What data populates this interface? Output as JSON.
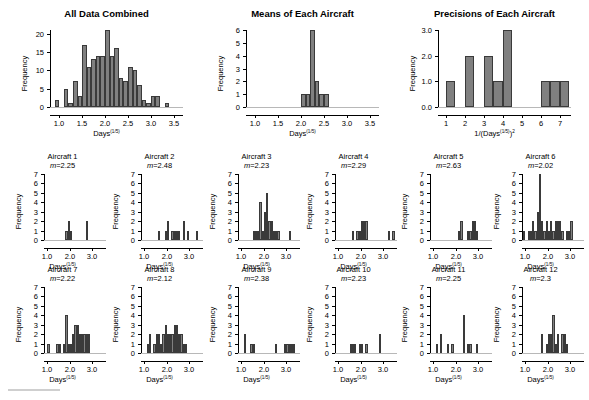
{
  "figure": {
    "width": 589,
    "height": 400,
    "background": "#ffffff",
    "bar_color": "#808080",
    "bar_edge_color": "#3a3a3a",
    "axis_color": "#000000",
    "baseline_color": "#b8b8b8"
  },
  "labels": {
    "frequency": "Frequency",
    "days_axis": "Days",
    "days_exponent": "(1/5)",
    "precision_axis_prefix": "1/(Days",
    "precision_axis_exponent": "(1/5)",
    "precision_axis_suffix": ")",
    "precision_axis_power": "2",
    "mean_prefix": "m="
  },
  "chart_data": [
    {
      "id": "all-data-combined",
      "type": "bar",
      "title": "All Data Combined",
      "xlabel": "Days^(1/5)",
      "ylabel": "Frequency",
      "xlim": [
        0.8,
        3.7
      ],
      "ylim": [
        0,
        21
      ],
      "xticks": [
        1.0,
        1.5,
        2.0,
        2.5,
        3.0,
        3.5
      ],
      "xtick_labels": [
        "1.0",
        "1.5",
        "2.0",
        "2.5",
        "3.0",
        "3.5"
      ],
      "yticks": [
        0,
        5,
        10,
        15,
        20
      ],
      "ytick_labels": [
        "0",
        "5",
        "10",
        "15",
        "20"
      ],
      "bin_width": 0.1,
      "bin_starts": [
        0.9,
        1.1,
        1.2,
        1.3,
        1.4,
        1.5,
        1.6,
        1.7,
        1.8,
        1.9,
        2.0,
        2.1,
        2.2,
        2.3,
        2.4,
        2.5,
        2.6,
        2.7,
        2.8,
        2.9,
        3.0,
        3.1,
        3.2,
        3.3,
        3.4,
        3.5
      ],
      "values": [
        2,
        5,
        1,
        7,
        3,
        17,
        11,
        13,
        14,
        14,
        21,
        14,
        16,
        8,
        7,
        11,
        10,
        6,
        2,
        1,
        3,
        3,
        0,
        1,
        0,
        0
      ],
      "grid": false,
      "legend": false
    },
    {
      "id": "means-of-each-aircraft",
      "type": "bar",
      "title": "Means of Each Aircraft",
      "xlabel": "Days^(1/5)",
      "ylabel": "Frequency",
      "xlim": [
        0.8,
        3.7
      ],
      "ylim": [
        0,
        6
      ],
      "xticks": [
        1.0,
        1.5,
        2.0,
        2.5,
        3.0,
        3.5
      ],
      "xtick_labels": [
        "1.0",
        "1.5",
        "2.0",
        "2.5",
        "3.0",
        "3.5"
      ],
      "yticks": [
        0,
        1,
        2,
        3,
        4,
        5,
        6
      ],
      "ytick_labels": [
        "0",
        "1",
        "2",
        "3",
        "4",
        "5",
        "6"
      ],
      "bin_width": 0.1,
      "bin_starts": [
        2.0,
        2.1,
        2.2,
        2.3,
        2.4,
        2.5
      ],
      "values": [
        1,
        1,
        6,
        2,
        1,
        1
      ],
      "grid": false,
      "legend": false
    },
    {
      "id": "precisions-of-each-aircraft",
      "type": "bar",
      "title": "Precisions of Each Aircraft",
      "xlabel": "1/(Days^(1/5))^2",
      "ylabel": "Frequency",
      "xlim": [
        0.6,
        7.6
      ],
      "ylim": [
        0,
        3.0
      ],
      "xticks": [
        1,
        2,
        3,
        4,
        5,
        6,
        7
      ],
      "xtick_labels": [
        "1",
        "2",
        "3",
        "4",
        "5",
        "6",
        "7"
      ],
      "yticks": [
        0.0,
        1.0,
        2.0,
        3.0
      ],
      "ytick_labels": [
        "0.0",
        "1.0",
        "2.0",
        "3.0"
      ],
      "bin_width": 0.5,
      "bin_starts": [
        1.0,
        2.0,
        3.0,
        3.5,
        4.0,
        6.0,
        6.5,
        7.0
      ],
      "values": [
        1,
        2,
        2,
        1,
        3,
        1,
        1,
        1
      ],
      "grid": false,
      "legend": false
    },
    {
      "id": "aircraft-1",
      "type": "bar",
      "title": "Aircraft 1",
      "mean_label": "m=2.25",
      "mean": 2.25,
      "xlabel": "Days^(1/5)",
      "ylabel": "Frequency",
      "xlim": [
        0.85,
        3.6
      ],
      "ylim": [
        0,
        7
      ],
      "xticks": [
        1.0,
        2.0,
        3.0
      ],
      "xtick_labels": [
        "1.0",
        "2.0",
        "3.0"
      ],
      "yticks": [
        0,
        1,
        2,
        3,
        4,
        5,
        6,
        7
      ],
      "ytick_labels": [
        "0",
        "1",
        "2",
        "3",
        "4",
        "5",
        "6",
        "7"
      ],
      "bin_width": 0.1,
      "bin_starts": [
        1.8,
        1.9,
        2.0,
        2.7
      ],
      "values": [
        1,
        2,
        1,
        2
      ],
      "grid": false,
      "legend": false
    },
    {
      "id": "aircraft-2",
      "type": "bar",
      "title": "Aircraft 2",
      "mean_label": "m=2.48",
      "mean": 2.48,
      "xlabel": "Days^(1/5)",
      "ylabel": "Frequency",
      "xlim": [
        0.85,
        3.6
      ],
      "ylim": [
        0,
        7
      ],
      "xticks": [
        1.0,
        2.0,
        3.0
      ],
      "xtick_labels": [
        "1.0",
        "2.0",
        "3.0"
      ],
      "yticks": [
        0,
        1,
        2,
        3,
        4,
        5,
        6,
        7
      ],
      "ytick_labels": [
        "0",
        "1",
        "2",
        "3",
        "4",
        "5",
        "6",
        "7"
      ],
      "bin_width": 0.1,
      "bin_starts": [
        1.6,
        1.9,
        2.0,
        2.2,
        2.3,
        2.4,
        2.5,
        2.7,
        2.9,
        3.3
      ],
      "values": [
        1,
        1,
        2,
        1,
        1,
        1,
        1,
        2,
        1,
        1
      ],
      "grid": false,
      "legend": false
    },
    {
      "id": "aircraft-3",
      "type": "bar",
      "title": "Aircraft 3",
      "mean_label": "m=2.23",
      "mean": 2.23,
      "xlabel": "Days^(1/5)",
      "ylabel": "Frequency",
      "xlim": [
        0.85,
        3.6
      ],
      "ylim": [
        0,
        7
      ],
      "xticks": [
        1.0,
        2.0,
        3.0
      ],
      "xtick_labels": [
        "1.0",
        "2.0",
        "3.0"
      ],
      "yticks": [
        0,
        1,
        2,
        3,
        4,
        5,
        6,
        7
      ],
      "ytick_labels": [
        "0",
        "1",
        "2",
        "3",
        "4",
        "5",
        "6",
        "7"
      ],
      "bin_width": 0.1,
      "bin_starts": [
        1.5,
        1.6,
        1.7,
        1.8,
        1.9,
        2.0,
        2.1,
        2.2,
        2.3,
        2.4,
        2.5,
        2.6,
        3.1
      ],
      "values": [
        1,
        1,
        1,
        4,
        1,
        3,
        5,
        2,
        2,
        1,
        1,
        1,
        1
      ],
      "grid": false,
      "legend": false
    },
    {
      "id": "aircraft-4",
      "type": "bar",
      "title": "Aircraft 4",
      "mean_label": "m=2.29",
      "mean": 2.29,
      "xlabel": "Days^(1/5)",
      "ylabel": "Frequency",
      "xlim": [
        0.85,
        3.6
      ],
      "ylim": [
        0,
        7
      ],
      "xticks": [
        1.0,
        2.0,
        3.0
      ],
      "xtick_labels": [
        "1.0",
        "2.0",
        "3.0"
      ],
      "yticks": [
        0,
        1,
        2,
        3,
        4,
        5,
        6,
        7
      ],
      "ytick_labels": [
        "0",
        "1",
        "2",
        "3",
        "4",
        "5",
        "6",
        "7"
      ],
      "bin_width": 0.1,
      "bin_starts": [
        1.6,
        1.8,
        1.9,
        2.0,
        2.1,
        2.2,
        3.2,
        3.4
      ],
      "values": [
        1,
        1,
        1,
        2,
        2,
        2,
        1,
        1
      ],
      "grid": false,
      "legend": false
    },
    {
      "id": "aircraft-5",
      "type": "bar",
      "title": "Aircraft 5",
      "mean_label": "m=2.63",
      "mean": 2.63,
      "xlabel": "Days^(1/5)",
      "ylabel": "Frequency",
      "xlim": [
        0.85,
        3.6
      ],
      "ylim": [
        0,
        7
      ],
      "xticks": [
        1.0,
        2.0,
        3.0
      ],
      "xtick_labels": [
        "1.0",
        "2.0",
        "3.0"
      ],
      "yticks": [
        0,
        1,
        2,
        3,
        4,
        5,
        6,
        7
      ],
      "ytick_labels": [
        "0",
        "1",
        "2",
        "3",
        "4",
        "5",
        "6",
        "7"
      ],
      "bin_width": 0.1,
      "bin_starts": [
        2.1,
        2.2,
        2.5,
        2.6,
        2.7,
        2.8,
        2.9
      ],
      "values": [
        1,
        2,
        1,
        1,
        2,
        2,
        1
      ],
      "grid": false,
      "legend": false
    },
    {
      "id": "aircraft-6",
      "type": "bar",
      "title": "Aircraft 6",
      "mean_label": "m=2.02",
      "mean": 2.02,
      "xlabel": "Days^(1/5)",
      "ylabel": "Frequency",
      "xlim": [
        0.85,
        3.6
      ],
      "ylim": [
        0,
        7
      ],
      "xticks": [
        1.0,
        2.0,
        3.0
      ],
      "xtick_labels": [
        "1.0",
        "2.0",
        "3.0"
      ],
      "yticks": [
        0,
        1,
        2,
        3,
        4,
        5,
        6,
        7
      ],
      "ytick_labels": [
        "0",
        "1",
        "2",
        "3",
        "4",
        "5",
        "6",
        "7"
      ],
      "bin_width": 0.1,
      "bin_starts": [
        0.9,
        1.1,
        1.2,
        1.3,
        1.4,
        1.5,
        1.6,
        1.7,
        1.8,
        1.9,
        2.0,
        2.1,
        2.2,
        2.3,
        2.4,
        2.5,
        2.6,
        2.8,
        2.9,
        3.0
      ],
      "values": [
        1,
        1,
        1,
        2,
        1,
        3,
        7,
        2,
        1,
        2,
        1,
        2,
        1,
        2,
        2,
        2,
        1,
        1,
        1,
        2
      ],
      "grid": false,
      "legend": false
    },
    {
      "id": "aircraft-7",
      "type": "bar",
      "title": "Aircraft 7",
      "mean_label": "m=2.22",
      "mean": 2.22,
      "xlabel": "Days^(1/5)",
      "ylabel": "Frequency",
      "xlim": [
        0.85,
        3.6
      ],
      "ylim": [
        0,
        7
      ],
      "xticks": [
        1.0,
        2.0,
        3.0
      ],
      "xtick_labels": [
        "1.0",
        "2.0",
        "3.0"
      ],
      "yticks": [
        0,
        1,
        2,
        3,
        4,
        5,
        6,
        7
      ],
      "ytick_labels": [
        "0",
        "1",
        "2",
        "3",
        "4",
        "5",
        "6",
        "7"
      ],
      "bin_width": 0.1,
      "bin_starts": [
        1.0,
        1.4,
        1.5,
        1.7,
        1.8,
        1.9,
        2.0,
        2.1,
        2.2,
        2.3,
        2.4,
        2.5,
        2.6,
        2.7,
        2.8
      ],
      "values": [
        1,
        1,
        1,
        1,
        4,
        1,
        1,
        2,
        3,
        3,
        2,
        2,
        2,
        2,
        2
      ],
      "grid": false,
      "legend": false
    },
    {
      "id": "aircraft-8",
      "type": "bar",
      "title": "Aircraft 8",
      "mean_label": "m=2.12",
      "mean": 2.12,
      "xlabel": "Days^(1/5)",
      "ylabel": "Frequency",
      "xlim": [
        0.85,
        3.6
      ],
      "ylim": [
        0,
        7
      ],
      "xticks": [
        1.0,
        2.0,
        3.0
      ],
      "xtick_labels": [
        "1.0",
        "2.0",
        "3.0"
      ],
      "yticks": [
        0,
        1,
        2,
        3,
        4,
        5,
        6,
        7
      ],
      "ytick_labels": [
        "0",
        "1",
        "2",
        "3",
        "4",
        "5",
        "6",
        "7"
      ],
      "bin_width": 0.1,
      "bin_starts": [
        1.1,
        1.2,
        1.4,
        1.5,
        1.6,
        1.7,
        1.8,
        1.9,
        2.0,
        2.1,
        2.2,
        2.3,
        2.4,
        2.5,
        2.6,
        2.7,
        2.8
      ],
      "values": [
        1,
        2,
        1,
        2,
        2,
        1,
        2,
        3,
        2,
        2,
        2,
        3,
        3,
        2,
        2,
        1,
        1
      ],
      "grid": false,
      "legend": false
    },
    {
      "id": "aircraft-9",
      "type": "bar",
      "title": "Aircraft 9",
      "mean_label": "m=2.38",
      "mean": 2.38,
      "xlabel": "Days^(1/5)",
      "ylabel": "Frequency",
      "xlim": [
        0.85,
        3.6
      ],
      "ylim": [
        0,
        7
      ],
      "xticks": [
        1.0,
        2.0,
        3.0
      ],
      "xtick_labels": [
        "1.0",
        "2.0",
        "3.0"
      ],
      "yticks": [
        0,
        1,
        2,
        3,
        4,
        5,
        6,
        7
      ],
      "ytick_labels": [
        "0",
        "1",
        "2",
        "3",
        "4",
        "5",
        "6",
        "7"
      ],
      "bin_width": 0.1,
      "bin_starts": [
        1.1,
        1.4,
        1.5,
        2.5,
        2.9,
        3.0,
        3.1,
        3.2,
        3.3
      ],
      "values": [
        2,
        1,
        1,
        1,
        1,
        1,
        1,
        1,
        1
      ],
      "grid": false,
      "legend": false
    },
    {
      "id": "aircraft-10",
      "type": "bar",
      "title": "Aircraft 10",
      "mean_label": "m=2.23",
      "mean": 2.23,
      "xlabel": "Days^(1/5)",
      "ylabel": "Frequency",
      "xlim": [
        0.85,
        3.6
      ],
      "ylim": [
        0,
        7
      ],
      "xticks": [
        1.0,
        2.0,
        3.0
      ],
      "xtick_labels": [
        "1.0",
        "2.0",
        "3.0"
      ],
      "yticks": [
        0,
        1,
        2,
        3,
        4,
        5,
        6,
        7
      ],
      "ytick_labels": [
        "0",
        "1",
        "2",
        "3",
        "4",
        "5",
        "6",
        "7"
      ],
      "bin_width": 0.1,
      "bin_starts": [
        1.5,
        1.6,
        1.7,
        1.9,
        2.0,
        2.2,
        2.8
      ],
      "values": [
        1,
        1,
        1,
        1,
        1,
        1,
        2
      ],
      "grid": false,
      "legend": false
    },
    {
      "id": "aircraft-11",
      "type": "bar",
      "title": "Aircraft 11",
      "mean_label": "m=2.25",
      "mean": 2.25,
      "xlabel": "Days^(1/5)",
      "ylabel": "Frequency",
      "xlim": [
        0.85,
        3.6
      ],
      "ylim": [
        0,
        7
      ],
      "xticks": [
        1.0,
        2.0,
        3.0
      ],
      "xtick_labels": [
        "1.0",
        "2.0",
        "3.0"
      ],
      "yticks": [
        0,
        1,
        2,
        3,
        4,
        5,
        6,
        7
      ],
      "ytick_labels": [
        "0",
        "1",
        "2",
        "3",
        "4",
        "5",
        "6",
        "7"
      ],
      "bin_width": 0.1,
      "bin_starts": [
        1.1,
        1.3,
        1.6,
        1.8,
        2.3,
        2.5,
        2.6,
        2.9
      ],
      "values": [
        1,
        2,
        1,
        1,
        4,
        1,
        1,
        1
      ],
      "grid": false,
      "legend": false
    },
    {
      "id": "aircraft-12",
      "type": "bar",
      "title": "Aircraft 12",
      "mean_label": "m=2.3",
      "mean": 2.3,
      "xlabel": "Days^(1/5)",
      "ylabel": "Frequency",
      "xlim": [
        0.85,
        3.6
      ],
      "ylim": [
        0,
        7
      ],
      "xticks": [
        1.0,
        2.0,
        3.0
      ],
      "xtick_labels": [
        "1.0",
        "2.0",
        "3.0"
      ],
      "yticks": [
        0,
        1,
        2,
        3,
        4,
        5,
        6,
        7
      ],
      "ytick_labels": [
        "0",
        "1",
        "2",
        "3",
        "4",
        "5",
        "6",
        "7"
      ],
      "bin_width": 0.1,
      "bin_starts": [
        1.7,
        1.9,
        2.0,
        2.1,
        2.2,
        2.3,
        2.4,
        2.6,
        2.7,
        2.8
      ],
      "values": [
        2,
        1,
        2,
        2,
        4,
        1,
        2,
        2,
        2,
        1
      ],
      "grid": false,
      "legend": false
    }
  ]
}
